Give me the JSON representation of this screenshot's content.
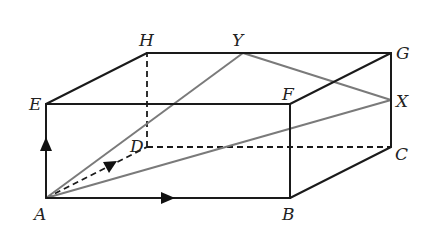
{
  "diagram": {
    "type": "cuboid",
    "vertices": {
      "A": {
        "label": "A",
        "x": 46,
        "y": 198
      },
      "B": {
        "label": "B",
        "x": 290,
        "y": 198
      },
      "C": {
        "label": "C",
        "x": 391,
        "y": 147
      },
      "D": {
        "label": "D",
        "x": 147,
        "y": 147
      },
      "E": {
        "label": "E",
        "x": 46,
        "y": 104
      },
      "F": {
        "label": "F",
        "x": 290,
        "y": 104
      },
      "G": {
        "label": "G",
        "x": 391,
        "y": 53
      },
      "H": {
        "label": "H",
        "x": 147,
        "y": 53
      },
      "X": {
        "label": "X",
        "x": 391,
        "y": 100
      },
      "Y": {
        "label": "Y",
        "x": 243,
        "y": 53
      }
    },
    "solid_edges": [
      "AB",
      "BC",
      "CG",
      "GF",
      "FB",
      "AE",
      "EF",
      "EH",
      "HG"
    ],
    "hidden_edges": [
      "AD",
      "DC",
      "DH"
    ],
    "gray_lines": [
      "AY",
      "AX",
      "YX"
    ],
    "arrows": [
      "AB direction",
      "AE direction",
      "AD direction"
    ],
    "colors": {
      "edge": "#1a1a1a",
      "diagonal": "#7a7a7a",
      "background": "#ffffff"
    }
  }
}
